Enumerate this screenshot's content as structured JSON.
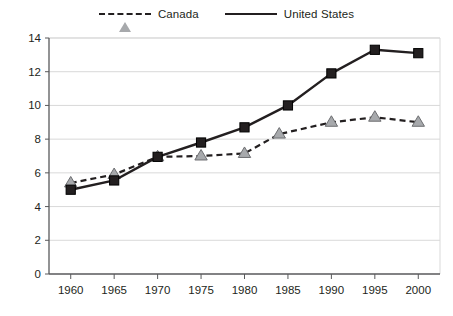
{
  "chart_data": {
    "type": "line",
    "title": "",
    "subtitle": "",
    "xlabel": "",
    "ylabel": "",
    "x": [
      1960,
      1965,
      1970,
      1975,
      1980,
      1985,
      1990,
      1995,
      2000
    ],
    "xtick_labels": [
      "1960",
      "1965",
      "1970",
      "1975",
      "1980",
      "1985",
      "1990",
      "1995",
      "2000"
    ],
    "xlim": [
      1957.5,
      2002.5
    ],
    "ytick_labels": [
      "0",
      "2",
      "4",
      "6",
      "8",
      "10",
      "12",
      "14"
    ],
    "yticks": [
      0,
      2,
      4,
      6,
      8,
      10,
      12,
      14
    ],
    "ylim": [
      0,
      14
    ],
    "grid": "horizontal",
    "legend_position": "top-center",
    "series": [
      {
        "name": "Canada",
        "marker": "triangle",
        "line_style": "dashed",
        "line_color": "#231f20",
        "marker_fill": "#a7a9ac",
        "x": [
          1960,
          1965,
          1970,
          1975,
          1980,
          1984,
          1990,
          1995,
          2000
        ],
        "values": [
          5.4,
          5.9,
          6.95,
          7.0,
          7.15,
          8.3,
          9.0,
          9.3,
          9.0
        ]
      },
      {
        "name": "United States",
        "marker": "square",
        "line_style": "solid",
        "line_color": "#231f20",
        "marker_fill": "#231f20",
        "x": [
          1960,
          1965,
          1970,
          1975,
          1980,
          1985,
          1990,
          1995,
          2000
        ],
        "values": [
          5.0,
          5.55,
          6.95,
          7.8,
          8.7,
          10.0,
          11.9,
          13.3,
          13.1
        ]
      }
    ]
  },
  "legend": {
    "entries": [
      {
        "label": "Canada",
        "key": "dashed-triangle-key"
      },
      {
        "label": "United States",
        "key": "solid-square-key"
      }
    ]
  },
  "colors": {
    "ink": "#231f20",
    "grid": "#d9d9d9",
    "axis": "#58595b",
    "canada_marker": "#a7a9ac",
    "us_marker": "#231f20",
    "background": "#ffffff"
  }
}
